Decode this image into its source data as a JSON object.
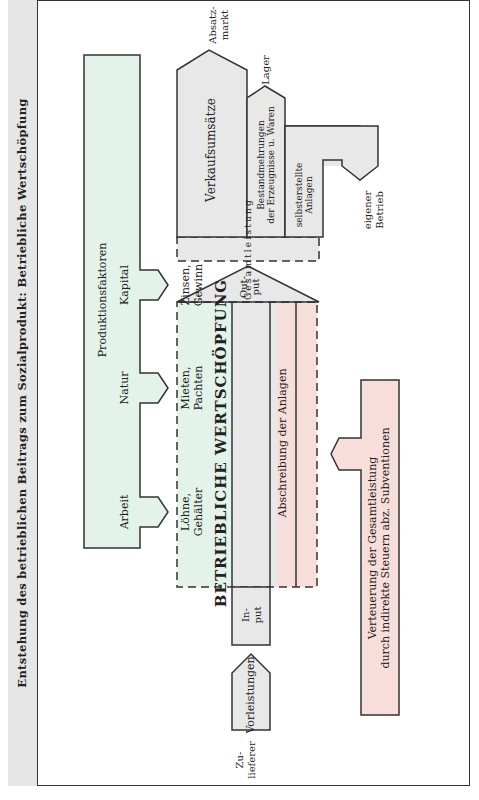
{
  "title": "Entstehung des betrieblichen Beitrags zum Sozialprodukt: Betriebliche Wertschöpfung",
  "colors": {
    "green": "#e3f3ea",
    "grey": "#e8e8e8",
    "pink": "#f7dedb",
    "title_bg": "#e6e6e6",
    "line": "#333333"
  },
  "production_factors": {
    "heading": "Produktionsfaktoren",
    "items": [
      "Arbeit",
      "Natur",
      "Kapital"
    ]
  },
  "value_added": {
    "label": "BETRIEBLICHE WERTSCHÖPFUNG",
    "components": [
      "Löhne, Gehälter",
      "Mieten, Pachten",
      "Zinsen, Gewinn"
    ],
    "line1": [
      "Löhne,",
      "Mieten,",
      "Zinsen,"
    ],
    "line2": [
      "Gehälter",
      "Pachten",
      "Gewinn"
    ]
  },
  "depreciation": "Abschreibung der Anlagen",
  "taxes": {
    "line1": "Verteuerung der Gesamtleistung",
    "line2": "durch indirekte Steuern abz. Subventionen"
  },
  "output": {
    "line1": "Out-",
    "line2": "put"
  },
  "input": {
    "line1": "In-",
    "line2": "put"
  },
  "inputs": {
    "arrow_label": "Vorleistungen",
    "source_line1": "Zu-",
    "source_line2": "lieferer"
  },
  "total_output": {
    "label": "Gesamtleistung",
    "letters": [
      "G",
      "e",
      "s",
      "a",
      "m",
      "t",
      "l",
      "e",
      "i",
      "s",
      "t",
      "u",
      "n",
      "g"
    ]
  },
  "output_uses": [
    {
      "label": "Verkaufsumsätze",
      "destination_line1": "Absatz-",
      "destination_line2": "markt"
    },
    {
      "label_line1": "Bestandmehrungen",
      "label_line2": "der Erzeugnisse u. Waren",
      "destination": "Lager"
    },
    {
      "label_line1": "selbsterstellte",
      "label_line2": "Anlagen",
      "destination_line1": "eigener",
      "destination_line2": "Betrieb"
    }
  ]
}
